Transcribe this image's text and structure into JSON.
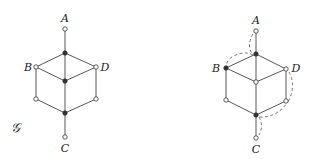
{
  "graph_label": "𝒢",
  "left_graph": {
    "labels": {
      "A": "A",
      "B": "B",
      "C": "C",
      "D": "D"
    },
    "nodes": [
      {
        "id": "A",
        "x": 65,
        "y": 29,
        "filled": false
      },
      {
        "id": "top",
        "x": 65,
        "y": 53,
        "filled": true
      },
      {
        "id": "B",
        "x": 36,
        "y": 67,
        "filled": false
      },
      {
        "id": "D",
        "x": 96,
        "y": 67,
        "filled": false
      },
      {
        "id": "center",
        "x": 65,
        "y": 81,
        "filled": true
      },
      {
        "id": "lowerLeft",
        "x": 36,
        "y": 99,
        "filled": false
      },
      {
        "id": "lowerRight",
        "x": 96,
        "y": 99,
        "filled": false
      },
      {
        "id": "bottom",
        "x": 65,
        "y": 113,
        "filled": true
      },
      {
        "id": "C",
        "x": 65,
        "y": 137,
        "filled": false
      }
    ]
  },
  "right_graph": {
    "labels": {
      "A": "A",
      "B": "B",
      "C": "C",
      "D": "D"
    },
    "nodes": [
      {
        "id": "A",
        "x": 256,
        "y": 31,
        "filled": false
      },
      {
        "id": "top",
        "x": 256,
        "y": 54,
        "filled": true
      },
      {
        "id": "B",
        "x": 226,
        "y": 68,
        "filled": true
      },
      {
        "id": "D",
        "x": 286,
        "y": 69,
        "filled": false
      },
      {
        "id": "center",
        "x": 256,
        "y": 82,
        "filled": false
      },
      {
        "id": "lowerLeft",
        "x": 226,
        "y": 100,
        "filled": false
      },
      {
        "id": "lowerRight",
        "x": 286,
        "y": 101,
        "filled": false
      },
      {
        "id": "bottom",
        "x": 256,
        "y": 115,
        "filled": true
      },
      {
        "id": "C",
        "x": 256,
        "y": 138,
        "filled": false
      }
    ],
    "dashed_paths": [
      "A-top",
      "top-B",
      "D-lowerRight",
      "lowerRight-bottom",
      "bottom-C"
    ]
  }
}
